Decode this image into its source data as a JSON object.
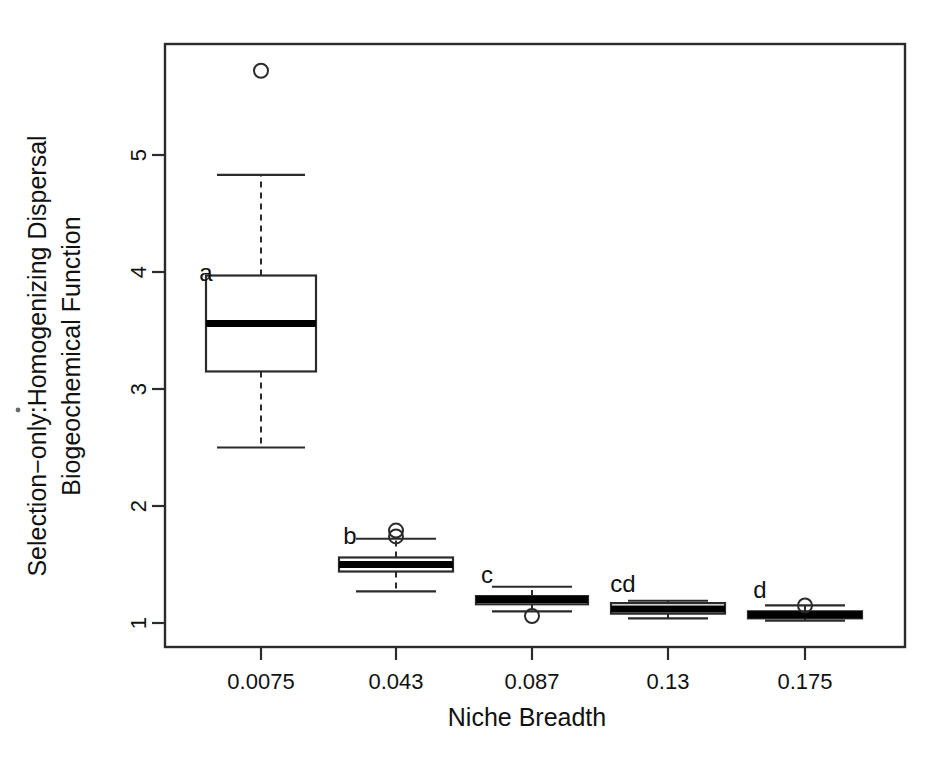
{
  "figure": {
    "type": "boxplot-figure",
    "background": "#ffffff",
    "ink_color": "#2b2b2b"
  },
  "chart_data": {
    "type": "box",
    "title": "",
    "xlabel": "Niche Breadth",
    "ylabel_line1": "Selection−only:Homogenizing Dispersal",
    "ylabel_line2": "Biogeochemical Function",
    "categories": [
      "0.0075",
      "0.043",
      "0.087",
      "0.13",
      "0.175"
    ],
    "xtick_labels": [
      "0.0075",
      "0.043",
      "0.087",
      "0.13",
      "0.175"
    ],
    "ytick_labels": [
      "1",
      "2",
      "3",
      "4",
      "5"
    ],
    "ytick_values": [
      1,
      2,
      3,
      4,
      5
    ],
    "ylim": [
      0.8,
      5.95
    ],
    "grid": false,
    "legend": "none",
    "group_letters": [
      "a",
      "b",
      "c",
      "cd",
      "d"
    ],
    "boxes": [
      {
        "category": "0.0075",
        "letter": "a",
        "whisker_low": 2.5,
        "q1": 3.15,
        "median": 3.56,
        "q3": 3.97,
        "whisker_high": 4.83,
        "outliers": [
          5.72
        ]
      },
      {
        "category": "0.043",
        "letter": "b",
        "whisker_low": 1.27,
        "q1": 1.44,
        "median": 1.5,
        "q3": 1.56,
        "whisker_high": 1.72,
        "outliers": [
          1.79,
          1.74
        ]
      },
      {
        "category": "0.087",
        "letter": "c",
        "whisker_low": 1.1,
        "q1": 1.16,
        "median": 1.2,
        "q3": 1.23,
        "whisker_high": 1.31,
        "outliers": [
          1.06
        ]
      },
      {
        "category": "0.13",
        "letter": "cd",
        "whisker_low": 1.04,
        "q1": 1.08,
        "median": 1.12,
        "q3": 1.17,
        "whisker_high": 1.19,
        "outliers": []
      },
      {
        "category": "0.175",
        "letter": "d",
        "whisker_low": 1.02,
        "q1": 1.04,
        "median": 1.07,
        "q3": 1.1,
        "whisker_high": 1.15,
        "outliers": [
          1.15
        ]
      }
    ]
  }
}
